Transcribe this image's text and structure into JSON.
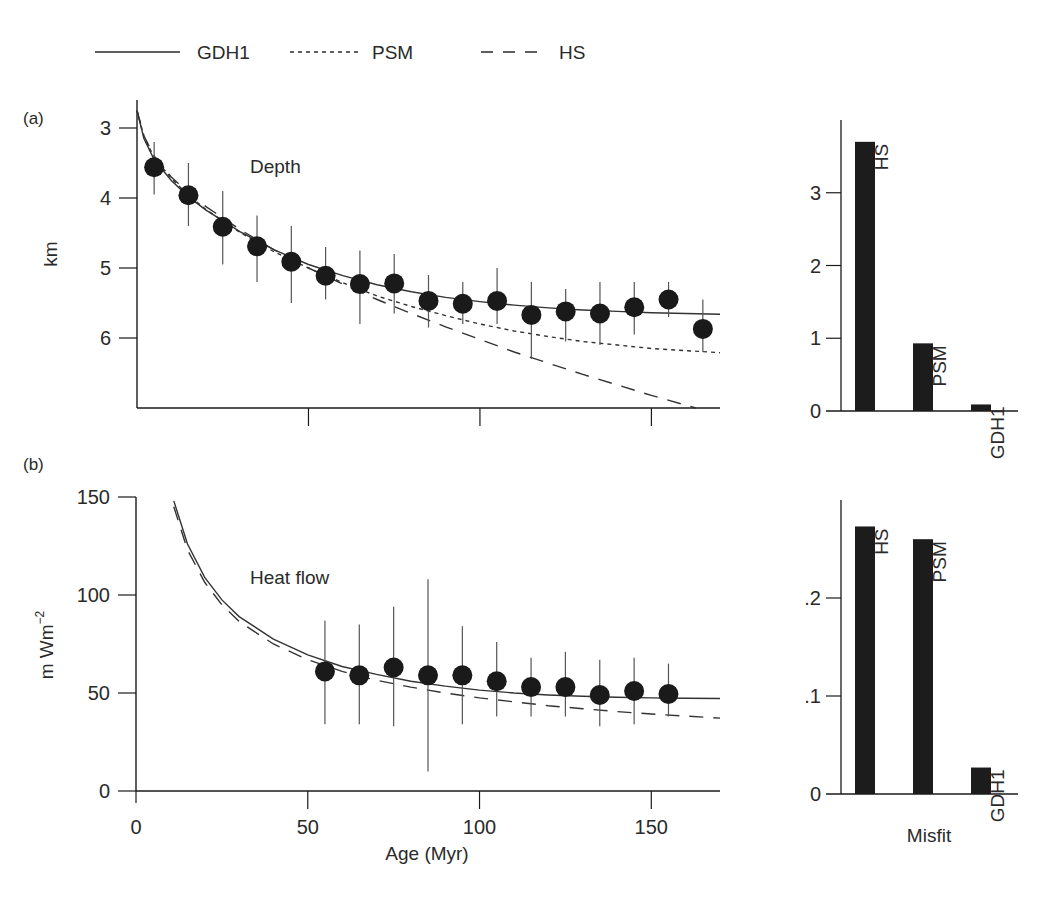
{
  "legend": {
    "items": [
      {
        "label": "GDH1",
        "style": "solid"
      },
      {
        "label": "PSM",
        "style": "dotted"
      },
      {
        "label": "HS",
        "style": "dashed"
      }
    ]
  },
  "panels": {
    "a": {
      "tag": "(a)",
      "title": "Depth",
      "ylabel": "km"
    },
    "b": {
      "tag": "(b)",
      "title": "Heat flow",
      "ylabel": "m Wm",
      "ylabel_sup": "−2"
    }
  },
  "xaxis": {
    "label": "Age (Myr)",
    "ticks": [
      "0",
      "50",
      "100",
      "150"
    ]
  },
  "misfit_label": "Misfit",
  "colors": {
    "ink": "#1a1a1a",
    "bar": "#1c1c1c",
    "line": "#333333"
  },
  "chart_data": [
    {
      "type": "scatter",
      "title": "Depth",
      "panel": "(a)",
      "xlabel": "Age (Myr)",
      "ylabel": "km",
      "xlim": [
        0,
        170
      ],
      "ylim": [
        7.0,
        2.6
      ],
      "y_inverted": true,
      "yticks": [
        3,
        4,
        5,
        6
      ],
      "xticks": [
        0,
        50,
        100,
        150
      ],
      "points": {
        "x": [
          5,
          15,
          25,
          35,
          45,
          55,
          65,
          75,
          85,
          95,
          105,
          115,
          125,
          135,
          145,
          155,
          165
        ],
        "y": [
          3.56,
          3.96,
          4.41,
          4.69,
          4.91,
          5.11,
          5.23,
          5.22,
          5.47,
          5.51,
          5.47,
          5.67,
          5.62,
          5.65,
          5.56,
          5.45,
          5.87
        ],
        "err_low": [
          3.2,
          3.5,
          3.9,
          4.25,
          4.4,
          4.7,
          4.75,
          4.8,
          5.1,
          5.2,
          5.0,
          5.2,
          5.3,
          5.2,
          5.2,
          5.2,
          5.45
        ],
        "err_high": [
          3.95,
          4.4,
          4.95,
          5.2,
          5.5,
          5.45,
          5.8,
          5.65,
          5.85,
          5.8,
          5.8,
          6.3,
          6.05,
          6.1,
          5.95,
          5.7,
          6.2
        ]
      },
      "series": [
        {
          "name": "GDH1",
          "style": "solid",
          "x": [
            0,
            2,
            5,
            10,
            15,
            20,
            30,
            40,
            50,
            60,
            70,
            80,
            90,
            100,
            110,
            120,
            130,
            140,
            150,
            160,
            170
          ],
          "y": [
            2.75,
            3.15,
            3.45,
            3.75,
            3.98,
            4.17,
            4.48,
            4.74,
            4.95,
            5.11,
            5.24,
            5.34,
            5.42,
            5.48,
            5.53,
            5.57,
            5.6,
            5.62,
            5.64,
            5.65,
            5.66
          ]
        },
        {
          "name": "PSM",
          "style": "dotted",
          "x": [
            0,
            2,
            5,
            10,
            15,
            20,
            30,
            40,
            50,
            60,
            70,
            80,
            90,
            100,
            110,
            120,
            130,
            140,
            150,
            160,
            170
          ],
          "y": [
            2.75,
            3.12,
            3.42,
            3.72,
            3.96,
            4.16,
            4.49,
            4.77,
            5.0,
            5.21,
            5.4,
            5.55,
            5.68,
            5.8,
            5.9,
            5.98,
            6.05,
            6.1,
            6.15,
            6.18,
            6.21
          ]
        },
        {
          "name": "HS",
          "style": "dashed",
          "x": [
            0,
            2,
            5,
            10,
            15,
            20,
            30,
            40,
            50,
            60,
            70,
            80,
            90,
            100,
            110,
            120,
            130,
            140,
            150,
            160,
            163
          ],
          "y": [
            2.75,
            3.11,
            3.4,
            3.7,
            3.93,
            4.12,
            4.45,
            4.74,
            5.0,
            5.23,
            5.45,
            5.65,
            5.84,
            6.02,
            6.2,
            6.36,
            6.52,
            6.67,
            6.82,
            6.96,
            7.0
          ]
        }
      ]
    },
    {
      "type": "bar",
      "title": "Misfit (depth)",
      "categories": [
        "HS",
        "PSM",
        "GDH1"
      ],
      "values": [
        3.7,
        0.93,
        0.09
      ],
      "ylim": [
        0,
        4.0
      ],
      "yticks": [
        "0",
        "1",
        "2",
        "3"
      ]
    },
    {
      "type": "scatter",
      "title": "Heat flow",
      "panel": "(b)",
      "xlabel": "Age (Myr)",
      "ylabel": "m Wm^-2",
      "xlim": [
        0,
        170
      ],
      "ylim": [
        0,
        150
      ],
      "yticks": [
        0,
        50,
        100,
        150
      ],
      "xticks": [
        0,
        50,
        100,
        150
      ],
      "points": {
        "x": [
          55,
          65,
          75,
          85,
          95,
          105,
          115,
          125,
          135,
          145,
          155
        ],
        "y": [
          61,
          59,
          63,
          59,
          59,
          56,
          53,
          53,
          49,
          51,
          49.5
        ],
        "err_low": [
          34,
          34,
          33,
          10,
          34,
          38,
          38,
          38,
          33,
          34,
          38
        ],
        "err_high": [
          87,
          85,
          94,
          108,
          84,
          76,
          68,
          71,
          67,
          68,
          65
        ]
      },
      "series": [
        {
          "name": "GDH1",
          "style": "solid",
          "x": [
            11,
            15,
            20,
            25,
            30,
            40,
            50,
            60,
            70,
            80,
            90,
            100,
            110,
            120,
            130,
            140,
            150,
            160,
            170
          ],
          "y": [
            148,
            126,
            109,
            97.5,
            89,
            77.5,
            69.5,
            63.5,
            59.5,
            56,
            53.5,
            51.5,
            50,
            49,
            48.3,
            47.8,
            47.5,
            47.3,
            47.2
          ]
        },
        {
          "name": "HS",
          "style": "dashed",
          "x": [
            11,
            15,
            20,
            25,
            30,
            40,
            50,
            60,
            70,
            80,
            90,
            100,
            110,
            120,
            130,
            140,
            150,
            160,
            170
          ],
          "y": [
            145,
            123,
            106.5,
            95,
            86.5,
            75,
            67,
            61,
            56.5,
            53,
            50,
            47.5,
            45.5,
            43.5,
            42,
            40.5,
            39.3,
            38.2,
            37.2
          ]
        }
      ]
    },
    {
      "type": "bar",
      "title": "Misfit (heat flow)",
      "xlabel": "Misfit",
      "categories": [
        "HS",
        "PSM",
        "GDH1"
      ],
      "values": [
        0.273,
        0.26,
        0.027
      ],
      "ylim": [
        0,
        0.3
      ],
      "yticks": [
        "0",
        ".1",
        ".2"
      ]
    }
  ]
}
